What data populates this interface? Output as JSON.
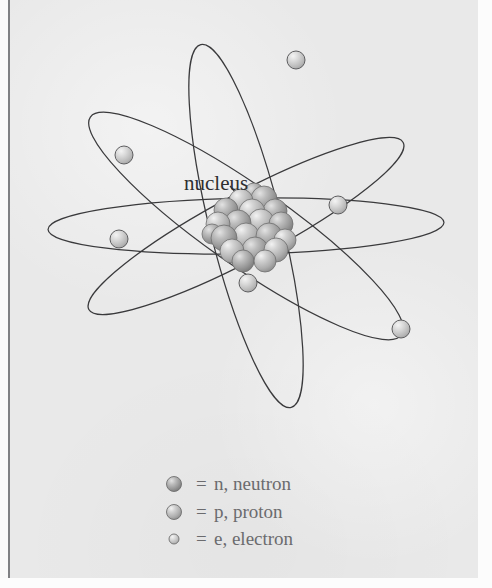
{
  "figure": {
    "kind": "atom-model-diagram",
    "title_label": "nucleus",
    "background_color": "#e9e9e9",
    "ink_color": "#3a3a3c",
    "text_color": "#2e2e30",
    "legend_text_color": "#6b6b6e"
  },
  "annotation": {
    "nucleus_label": "nucleus",
    "leader_line": {
      "from_x": 230,
      "from_y": 186,
      "to_x": 252,
      "to_y": 212
    }
  },
  "nucleus": {
    "center_x": 246,
    "center_y": 226,
    "particle_radius": 13,
    "neutron_color": "#9a9a9a",
    "proton_color": "#b9b9b9",
    "particles": [
      {
        "x": 241,
        "y": 201,
        "type": "p",
        "r": 12
      },
      {
        "x": 264,
        "y": 199,
        "type": "n",
        "r": 13
      },
      {
        "x": 226,
        "y": 210,
        "type": "n",
        "r": 12
      },
      {
        "x": 252,
        "y": 212,
        "type": "p",
        "r": 13
      },
      {
        "x": 275,
        "y": 211,
        "type": "n",
        "r": 12
      },
      {
        "x": 218,
        "y": 224,
        "type": "p",
        "r": 12
      },
      {
        "x": 238,
        "y": 223,
        "type": "n",
        "r": 13
      },
      {
        "x": 261,
        "y": 222,
        "type": "p",
        "r": 13
      },
      {
        "x": 281,
        "y": 224,
        "type": "n",
        "r": 12
      },
      {
        "x": 224,
        "y": 238,
        "type": "n",
        "r": 13
      },
      {
        "x": 246,
        "y": 236,
        "type": "p",
        "r": 13
      },
      {
        "x": 269,
        "y": 236,
        "type": "n",
        "r": 13
      },
      {
        "x": 285,
        "y": 240,
        "type": "p",
        "r": 11
      },
      {
        "x": 232,
        "y": 251,
        "type": "p",
        "r": 12
      },
      {
        "x": 255,
        "y": 250,
        "type": "n",
        "r": 13
      },
      {
        "x": 276,
        "y": 250,
        "type": "p",
        "r": 12
      },
      {
        "x": 243,
        "y": 261,
        "type": "n",
        "r": 11
      },
      {
        "x": 265,
        "y": 261,
        "type": "p",
        "r": 11
      },
      {
        "x": 212,
        "y": 234,
        "type": "n",
        "r": 10
      },
      {
        "x": 254,
        "y": 193,
        "type": "n",
        "r": 10
      }
    ]
  },
  "orbits": [
    {
      "name": "orbit-horizontal",
      "cx": 246,
      "cy": 226,
      "rx": 198,
      "ry": 28,
      "rotation": -1
    },
    {
      "name": "orbit-steep-right",
      "cx": 246,
      "cy": 226,
      "rx": 187,
      "ry": 36,
      "rotation": 76
    },
    {
      "name": "orbit-diagonal-nw-se",
      "cx": 246,
      "cy": 226,
      "rx": 190,
      "ry": 40,
      "rotation": 35
    },
    {
      "name": "orbit-diagonal-ne-sw",
      "cx": 246,
      "cy": 226,
      "rx": 178,
      "ry": 33,
      "rotation": -28
    }
  ],
  "electrons": {
    "color": "#c4c4c4",
    "radius": 9,
    "positions": [
      {
        "name": "electron-top",
        "x": 296,
        "y": 60
      },
      {
        "name": "electron-upper-left",
        "x": 124,
        "y": 155
      },
      {
        "name": "electron-right",
        "x": 338,
        "y": 205
      },
      {
        "name": "electron-left",
        "x": 119,
        "y": 239
      },
      {
        "name": "electron-lower-center",
        "x": 248,
        "y": 283
      },
      {
        "name": "electron-lower-right",
        "x": 401,
        "y": 329
      }
    ]
  },
  "legend": {
    "items": [
      {
        "key": "neutron",
        "marker": "neutron-sphere",
        "equals": "=",
        "label": "n, neutron",
        "marker_size": 15,
        "marker_color": "#9a9a9a",
        "y": 490
      },
      {
        "key": "proton",
        "marker": "proton-sphere",
        "equals": "=",
        "label": "p, proton",
        "marker_size": 15,
        "marker_color": "#b0b0b0",
        "y": 518
      },
      {
        "key": "electron",
        "marker": "electron-sphere",
        "equals": "=",
        "label": "e, electron",
        "marker_size": 10,
        "marker_color": "#c4c4c4",
        "y": 545
      }
    ]
  }
}
